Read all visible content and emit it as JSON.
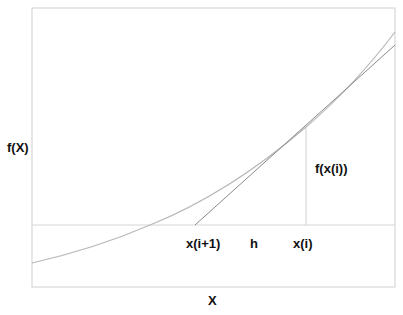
{
  "diagram": {
    "labels": {
      "y_axis": "f(X)",
      "x_axis": "X",
      "x_next": "x(i+1)",
      "step": "h",
      "x_current": "x(i)",
      "f_value": "f(x(i))"
    },
    "colors": {
      "frame": "#cfcfcf",
      "curve": "#b8b8b8",
      "tangent": "#8a8a8a",
      "reference_line": "#d6d6d6",
      "text": "#111111"
    },
    "geometry": {
      "frame": {
        "left": 32,
        "top": 8,
        "right": 395,
        "bottom": 287
      },
      "zero_line_y": 225,
      "tangent_point": {
        "x": 306,
        "y": 127
      },
      "tangent_root_x": 195,
      "curve_root_x": 150
    }
  }
}
